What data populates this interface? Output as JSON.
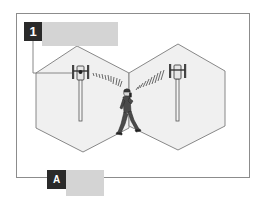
{
  "diagram": {
    "type": "cellular-handover-illustration",
    "colors": {
      "frame": "#8c8c8c",
      "cell_fill": "#f0f0f0",
      "cell_stroke": "#7a7a7a",
      "label_dark": "#2a2a2a",
      "label_bar": "#d4d4d4",
      "signal": "#5a5a5a",
      "person": "#4a4a4a"
    },
    "cells": [
      {
        "name": "left-cell",
        "has_antenna": true
      },
      {
        "name": "right-cell",
        "has_antenna": true
      }
    ],
    "callouts": [
      {
        "id": "1",
        "label": "1",
        "text": ""
      },
      {
        "id": "A",
        "label": "A",
        "text": ""
      }
    ],
    "figure": {
      "description": "person walking between two cell towers with mobile phone"
    }
  }
}
